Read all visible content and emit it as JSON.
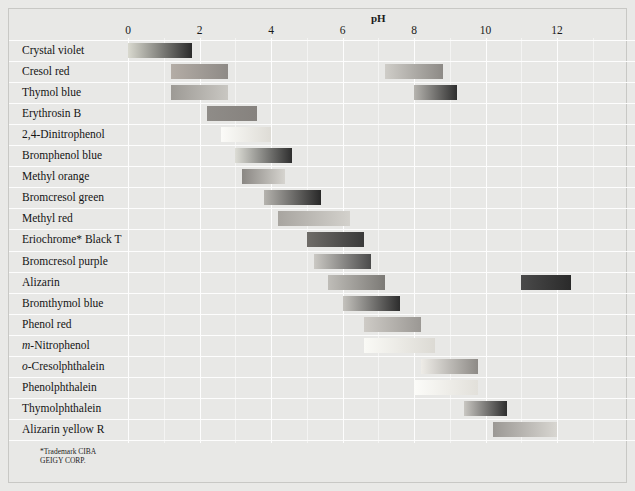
{
  "chart_data": {
    "type": "bar",
    "title": "pH",
    "xlabel": "pH",
    "ylabel": "",
    "xlim": [
      -0.45,
      13.25
    ],
    "ylim": [
      0,
      19
    ],
    "grid": true,
    "legend": false,
    "orientation": "horizontal",
    "xticks": [
      0,
      2,
      4,
      6,
      8,
      10,
      12
    ],
    "xtick_labels": [
      "0",
      "2",
      "4",
      "6",
      "8",
      "10",
      "12"
    ],
    "categories": [
      "Crystal violet",
      "Cresol red",
      "Thymol blue",
      "Erythrosin B",
      "2,4-Dinitrophenol",
      "Bromphenol blue",
      "Methyl orange",
      "Bromcresol green",
      "Methyl red",
      "Eriochrome* Black T",
      "Bromcresol purple",
      "Alizarin",
      "Bromthymol blue",
      "Phenol red",
      "m-Nitrophenol",
      "o-Cresolphthalein",
      "Phenolphthalein",
      "Thymolphthalein",
      "Alizarin yellow R"
    ],
    "series": [
      {
        "name": "transition range",
        "bands": [
          {
            "indicator": "Crystal violet",
            "ranges": [
              [
                0.0,
                1.8
              ]
            ]
          },
          {
            "indicator": "Cresol red",
            "ranges": [
              [
                1.2,
                2.8
              ],
              [
                7.2,
                8.8
              ]
            ]
          },
          {
            "indicator": "Thymol blue",
            "ranges": [
              [
                1.2,
                2.8
              ],
              [
                8.0,
                9.2
              ]
            ]
          },
          {
            "indicator": "Erythrosin B",
            "ranges": [
              [
                2.2,
                3.6
              ]
            ]
          },
          {
            "indicator": "2,4-Dinitrophenol",
            "ranges": [
              [
                2.6,
                4.0
              ]
            ]
          },
          {
            "indicator": "Bromphenol blue",
            "ranges": [
              [
                3.0,
                4.6
              ]
            ]
          },
          {
            "indicator": "Methyl orange",
            "ranges": [
              [
                3.2,
                4.4
              ]
            ]
          },
          {
            "indicator": "Bromcresol green",
            "ranges": [
              [
                3.8,
                5.4
              ]
            ]
          },
          {
            "indicator": "Methyl red",
            "ranges": [
              [
                4.2,
                6.2
              ]
            ]
          },
          {
            "indicator": "Eriochrome* Black T",
            "ranges": [
              [
                5.0,
                6.6
              ]
            ]
          },
          {
            "indicator": "Bromcresol purple",
            "ranges": [
              [
                5.2,
                6.8
              ]
            ]
          },
          {
            "indicator": "Alizarin",
            "ranges": [
              [
                5.6,
                7.2
              ],
              [
                11.0,
                12.4
              ]
            ]
          },
          {
            "indicator": "Bromthymol blue",
            "ranges": [
              [
                6.0,
                7.6
              ]
            ]
          },
          {
            "indicator": "Phenol red",
            "ranges": [
              [
                6.6,
                8.2
              ]
            ]
          },
          {
            "indicator": "m-Nitrophenol",
            "ranges": [
              [
                6.6,
                8.6
              ]
            ]
          },
          {
            "indicator": "o-Cresolphthalein",
            "ranges": [
              [
                8.2,
                9.8
              ]
            ]
          },
          {
            "indicator": "Phenolphthalein",
            "ranges": [
              [
                8.0,
                9.8
              ]
            ]
          },
          {
            "indicator": "Thymolphthalein",
            "ranges": [
              [
                9.4,
                10.6
              ]
            ]
          },
          {
            "indicator": "Alizarin yellow R",
            "ranges": [
              [
                10.2,
                12.0
              ]
            ]
          }
        ]
      }
    ],
    "bar_colors": [
      {
        "indicator": "Crystal violet",
        "band": 0,
        "from": "#d9d9cf",
        "to": "#2b2b2b"
      },
      {
        "indicator": "Cresol red",
        "band": 0,
        "from": "#b4ada6",
        "to": "#8e8a86"
      },
      {
        "indicator": "Cresol red",
        "band": 1,
        "from": "#cfcdc8",
        "to": "#8d8a86"
      },
      {
        "indicator": "Thymol blue",
        "band": 0,
        "from": "#9d9a95",
        "to": "#c9c7c2"
      },
      {
        "indicator": "Thymol blue",
        "band": 1,
        "from": "#b6b4af",
        "to": "#2f2f2f"
      },
      {
        "indicator": "Erythrosin B",
        "band": 0,
        "from": "#8f8c88",
        "to": "#86827e"
      },
      {
        "indicator": "2,4-Dinitrophenol",
        "band": 0,
        "from": "#fbfbf8",
        "to": "#dedcd6"
      },
      {
        "indicator": "Bromphenol blue",
        "band": 0,
        "from": "#ddddd6",
        "to": "#2e2e2e"
      },
      {
        "indicator": "Methyl orange",
        "band": 0,
        "from": "#8a8783",
        "to": "#d6d4cf"
      },
      {
        "indicator": "Bromcresol green",
        "band": 0,
        "from": "#b5b3ae",
        "to": "#282828"
      },
      {
        "indicator": "Methyl red",
        "band": 0,
        "from": "#a8a5a0",
        "to": "#d3d1cc"
      },
      {
        "indicator": "Eriochrome* Black T",
        "band": 0,
        "from": "#6f6c68",
        "to": "#3a3a3a"
      },
      {
        "indicator": "Bromcresol purple",
        "band": 0,
        "from": "#cbc9c4",
        "to": "#4b4b4b"
      },
      {
        "indicator": "Alizarin",
        "band": 0,
        "from": "#bfbdb8",
        "to": "#7c7a76"
      },
      {
        "indicator": "Alizarin",
        "band": 1,
        "from": "#4a4a4a",
        "to": "#2a2a2a"
      },
      {
        "indicator": "Bromthymol blue",
        "band": 0,
        "from": "#c4c2bd",
        "to": "#2d2d2d"
      },
      {
        "indicator": "Phenol red",
        "band": 0,
        "from": "#cecbc6",
        "to": "#9b9894"
      },
      {
        "indicator": "m-Nitrophenol",
        "band": 0,
        "from": "#fafaf6",
        "to": "#dcdad4"
      },
      {
        "indicator": "o-Cresolphthalein",
        "band": 0,
        "from": "#eeece7",
        "to": "#8d8a86"
      },
      {
        "indicator": "Phenolphthalein",
        "band": 0,
        "from": "#fcfcf9",
        "to": "#e2e0da"
      },
      {
        "indicator": "Thymolphthalein",
        "band": 0,
        "from": "#c9c7c2",
        "to": "#2e2e2e"
      },
      {
        "indicator": "Alizarin yellow R",
        "band": 0,
        "from": "#9b9894",
        "to": "#d8d6d1"
      }
    ]
  },
  "footnote": {
    "text": "*Trademark CIBA\nGEIGY CORP."
  },
  "colors": {
    "background": "#e8e8e6",
    "gridline": "#fdfdfd",
    "text": "#141414",
    "border": "#c8c8c5"
  }
}
